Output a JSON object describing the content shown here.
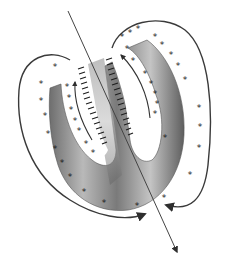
{
  "diagram": {
    "colors": {
      "background": "#ffffff",
      "tissue_dark": "#5a5a5a",
      "tissue_light": "#c8c8c8",
      "ink": "#1e1e1e",
      "loop": "#3a3a3a"
    },
    "symbols": {
      "outer_marker": "*",
      "inner_marker": "*",
      "lining_marker": "-"
    },
    "outer_stars": [
      [
        55,
        67
      ],
      [
        41,
        84
      ],
      [
        41,
        101
      ],
      [
        45,
        116
      ],
      [
        48,
        134
      ],
      [
        55,
        149
      ],
      [
        62,
        163
      ],
      [
        70,
        177
      ],
      [
        84,
        192
      ],
      [
        104,
        203
      ],
      [
        134,
        206
      ],
      [
        122,
        37
      ],
      [
        130,
        33
      ],
      [
        137,
        29
      ],
      [
        155,
        37
      ],
      [
        162,
        45
      ],
      [
        171,
        55
      ],
      [
        178,
        66
      ],
      [
        185,
        80
      ],
      [
        191,
        95
      ],
      [
        192,
        111
      ],
      [
        191,
        128
      ],
      [
        186,
        155
      ]
    ],
    "inner_stars": [
      [
        67,
        87
      ],
      [
        69,
        98
      ],
      [
        71,
        110
      ],
      [
        75,
        121
      ],
      [
        79,
        131
      ],
      [
        86,
        144
      ],
      [
        93,
        153
      ],
      [
        125,
        49
      ],
      [
        128,
        61
      ],
      [
        133,
        72
      ],
      [
        136,
        82
      ],
      [
        139,
        93
      ],
      [
        141,
        103
      ],
      [
        141,
        113
      ],
      [
        158,
        170
      ]
    ],
    "markers_bottom": [
      [
        164,
        198
      ]
    ],
    "loops": [
      {
        "name": "left-loop",
        "arrow_end": [
          146,
          213
        ]
      },
      {
        "name": "right-loop",
        "arrow_end": [
          167,
          205
        ]
      }
    ],
    "axis": {
      "start": [
        68,
        11
      ],
      "end": [
        177,
        252
      ]
    }
  }
}
